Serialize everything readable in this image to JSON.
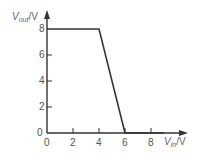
{
  "chart_data": {
    "type": "line",
    "title": "",
    "xlabel": "V_in/V",
    "ylabel": "V_out/V",
    "xlabel_parts": {
      "var": "V",
      "sub": "in",
      "unit": "/V"
    },
    "ylabel_parts": {
      "var": "V",
      "sub": "out",
      "unit": "/V"
    },
    "x_ticks": [
      "0",
      "2",
      "4",
      "6",
      "8"
    ],
    "y_ticks": [
      "0",
      "2",
      "4",
      "6",
      "8"
    ],
    "xlim": [
      0,
      10.5
    ],
    "ylim": [
      0,
      9.2
    ],
    "grid": false,
    "legend": null,
    "series": [
      {
        "name": "V_out vs V_in",
        "x": [
          0,
          4,
          6,
          9
        ],
        "y": [
          8,
          8,
          0,
          0
        ],
        "color": "#333333"
      }
    ]
  },
  "colors": {
    "axis": "#333333",
    "line": "#333333",
    "text": "#555555"
  }
}
